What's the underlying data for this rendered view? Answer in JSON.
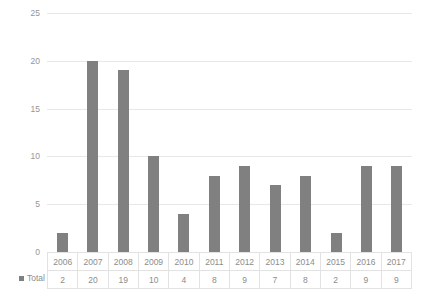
{
  "chart_data": {
    "type": "bar",
    "title": "",
    "subtitle": "",
    "xlabel": "",
    "ylabel": "",
    "categories": [
      "2006",
      "2007",
      "2008",
      "2009",
      "2010",
      "2011",
      "2012",
      "2013",
      "2014",
      "2015",
      "2016",
      "2017"
    ],
    "series": [
      {
        "name": "Total",
        "values": [
          2,
          20,
          19,
          10,
          4,
          8,
          9,
          7,
          8,
          2,
          9,
          9
        ],
        "color": "#808080"
      }
    ],
    "ylim": [
      0,
      25
    ],
    "yticks": [
      0,
      5,
      10,
      15,
      20,
      25
    ],
    "ytick_labels": [
      "0",
      "5",
      "10",
      "15",
      "20",
      "25"
    ],
    "grid": true,
    "legend_position": "bottom-left",
    "data_table_visible": true,
    "data_table": {
      "header_row": [
        "2006",
        "2007",
        "2008",
        "2009",
        "2010",
        "2011",
        "2012",
        "2013",
        "2014",
        "2015",
        "2016",
        "2017"
      ],
      "rows": [
        {
          "label": "Total",
          "values": [
            "2",
            "20",
            "19",
            "10",
            "4",
            "8",
            "9",
            "7",
            "8",
            "2",
            "9",
            "9"
          ]
        }
      ]
    }
  },
  "colors": {
    "bar": "#808080",
    "gridline": "#e8e8e8",
    "baseline": "#d9d9d9",
    "text": "#8c8c8c",
    "table_border": "#e2e2e2",
    "background": "#ffffff"
  }
}
